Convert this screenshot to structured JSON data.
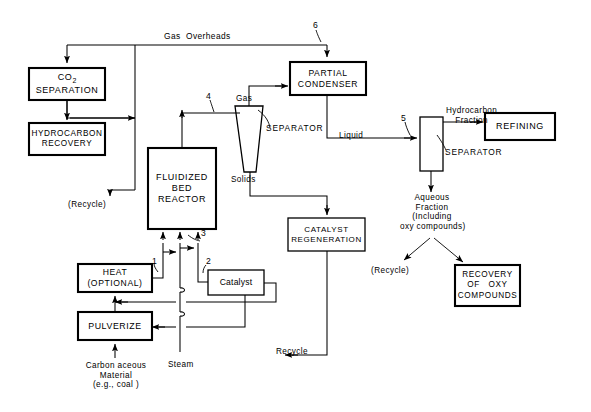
{
  "diagram": {
    "line_color": "#000000",
    "box_fill": "#ffffff",
    "background": "#ffffff"
  },
  "boxes": {
    "co2_separation": {
      "line1": "CO",
      "sub": "2",
      "line2": "SEPARATION"
    },
    "hydrocarbon_recovery": {
      "label": "HYDROCARBON\nRECOVERY"
    },
    "fluidized_bed_reactor": {
      "label": "FLUIDIZED\nBED\nREACTOR"
    },
    "partial_condenser": {
      "label": "PARTIAL\nCONDENSER"
    },
    "refining": {
      "label": "REFINING"
    },
    "catalyst_regeneration": {
      "label": "CATALYST\nREGENERATION"
    },
    "recovery_oxy": {
      "label": "RECOVERY\nOF   OXY\nCOMPOUNDS"
    },
    "heat_optional": {
      "label": "HEAT\n(OPTIONAL)"
    },
    "pulverize": {
      "label": "PULVERIZE"
    },
    "catalyst": {
      "label": "Catalyst"
    },
    "liquid_separator": {
      "label": ""
    }
  },
  "stream_labels": {
    "gas_overheads": "Gas  Overheads",
    "gas": "Gas",
    "solids": "Solids",
    "liquid": "Liquid",
    "separator_cone": "SEPARATOR",
    "separator_column": "SEPARATOR",
    "hydrocarbon_fraction": "Hydrocarbon\nFraction",
    "aqueous_fraction": "Aqueous\nFraction\n(Including\noxy compounds)",
    "recycle_left": "(Recycle)",
    "recycle_aqueous": "(Recycle)",
    "recycle_catalyst": "Recycle",
    "steam": "Steam",
    "carbonaceous": "Carbon aceous\nMaterial\n(e.g., coal )"
  },
  "reference_numerals": {
    "n1": "1",
    "n2": "2",
    "n3": "3",
    "n4": "4",
    "n5": "5",
    "n6": "6"
  }
}
